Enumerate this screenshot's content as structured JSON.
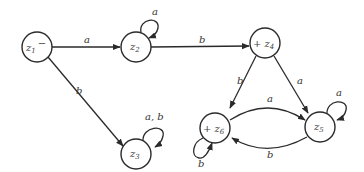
{
  "diagram": {
    "type": "finite-automaton",
    "nodes": [
      {
        "id": "z1",
        "label": "z",
        "sub": "1",
        "prefix": "",
        "suffix": "−",
        "x": 37,
        "y": 47,
        "start": true,
        "accept": false
      },
      {
        "id": "z2",
        "label": "z",
        "sub": "2",
        "prefix": "",
        "suffix": "",
        "x": 136,
        "y": 47,
        "start": false,
        "accept": false
      },
      {
        "id": "z3",
        "label": "z",
        "sub": "3",
        "prefix": "",
        "suffix": "",
        "x": 136,
        "y": 154,
        "start": false,
        "accept": false
      },
      {
        "id": "z4",
        "label": "z",
        "sub": "4",
        "prefix": "+ ",
        "suffix": "",
        "x": 265,
        "y": 43,
        "start": false,
        "accept": true
      },
      {
        "id": "z5",
        "label": "z",
        "sub": "5",
        "prefix": "",
        "suffix": "",
        "x": 320,
        "y": 127,
        "start": false,
        "accept": false
      },
      {
        "id": "z6",
        "label": "z",
        "sub": "6",
        "prefix": "+ ",
        "suffix": "",
        "x": 215,
        "y": 128,
        "start": false,
        "accept": true
      }
    ],
    "edges": [
      {
        "from": "z1",
        "to": "z2",
        "label": "a"
      },
      {
        "from": "z1",
        "to": "z3",
        "label": "b"
      },
      {
        "from": "z2",
        "to": "z2",
        "label": "a"
      },
      {
        "from": "z2",
        "to": "z4",
        "label": "b"
      },
      {
        "from": "z3",
        "to": "z3",
        "label": "a, b"
      },
      {
        "from": "z4",
        "to": "z6",
        "label": "b"
      },
      {
        "from": "z4",
        "to": "z5",
        "label": "a"
      },
      {
        "from": "z6",
        "to": "z5",
        "label": "a"
      },
      {
        "from": "z5",
        "to": "z6",
        "label": "b"
      },
      {
        "from": "z5",
        "to": "z5",
        "label": "a"
      },
      {
        "from": "z6",
        "to": "z6",
        "label": "b"
      }
    ]
  }
}
